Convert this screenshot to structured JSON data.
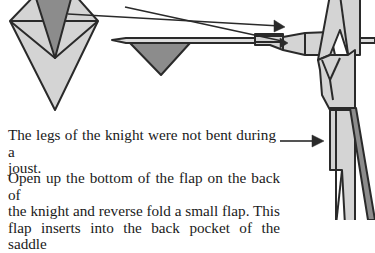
{
  "diagram": {
    "type": "origami-instruction-step",
    "subject": "knight",
    "fill_light": "#d4d4d4",
    "fill_dark": "#8c8c8c",
    "stroke": "#2a2a2a"
  },
  "notes": {
    "legs": {
      "lines": [
        "The legs of the knight were not bent during a",
        "joust."
      ]
    },
    "flap": {
      "lines": [
        "Open up the bottom of the flap on the back of",
        "the knight and reverse fold a small flap. This",
        "flap inserts into the back pocket of the saddle"
      ]
    }
  },
  "arrows": [
    {
      "name": "arrow-from-kite-to-lance-hand"
    },
    {
      "name": "arrow-along-lance-to-arm"
    },
    {
      "name": "arrow-to-legs"
    }
  ]
}
